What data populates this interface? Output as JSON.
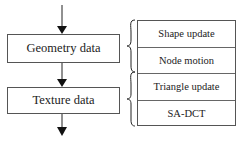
{
  "flow": {
    "boxes": [
      {
        "label": "Geometry data"
      },
      {
        "label": "Texture data"
      }
    ]
  },
  "components": {
    "items": [
      {
        "label": "Shape update"
      },
      {
        "label": "Node motion"
      },
      {
        "label": "Triangle update"
      },
      {
        "label": "SA-DCT"
      }
    ]
  },
  "colors": {
    "line": "#222222",
    "border": "#555555",
    "background": "#ffffff"
  }
}
